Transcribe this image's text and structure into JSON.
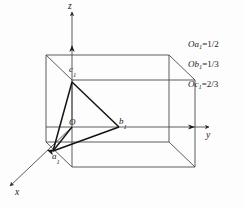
{
  "figure": {
    "background_color": "#fdfdfd",
    "line_color": "#3a3a3a",
    "heavy_line_color": "#1a1a1a",
    "text_color": "#1a1a1a"
  },
  "axes": [
    {
      "id": "x",
      "label": "x",
      "sublabel": "",
      "direction": "front-left-down"
    },
    {
      "id": "y",
      "label": "y",
      "sublabel": "",
      "direction": "right"
    },
    {
      "id": "z",
      "label": "z",
      "sublabel": "",
      "direction": "up"
    }
  ],
  "points": [
    {
      "id": "origin",
      "label": "O",
      "sublabel": ""
    },
    {
      "id": "a1",
      "label": "a",
      "sublabel": "1"
    },
    {
      "id": "b1",
      "label": "b",
      "sublabel": "1"
    },
    {
      "id": "c1",
      "label": "c",
      "sublabel": "1"
    }
  ],
  "annotations": [
    {
      "id": "oa1",
      "segment": "Oa",
      "sub": "1",
      "value": "=1/2"
    },
    {
      "id": "ob1",
      "segment": "Ob",
      "sub": "1",
      "value": "=1/3"
    },
    {
      "id": "oc1",
      "segment": "Oc",
      "sub": "1",
      "value": "=2/3"
    }
  ]
}
